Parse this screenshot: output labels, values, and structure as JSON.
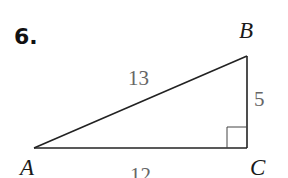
{
  "problem": {
    "number": "6."
  },
  "figure": {
    "type": "right-triangle",
    "vertices": {
      "A": {
        "label": "A"
      },
      "B": {
        "label": "B"
      },
      "C": {
        "label": "C"
      }
    },
    "sides": {
      "AB": {
        "label": "13"
      },
      "BC": {
        "label": "5"
      },
      "AC": {
        "label": "12"
      }
    },
    "right_angle_at": "C",
    "colors": {
      "line": "#222222",
      "side_label": "#666666",
      "vertex_label": "#1a1a1a"
    }
  }
}
